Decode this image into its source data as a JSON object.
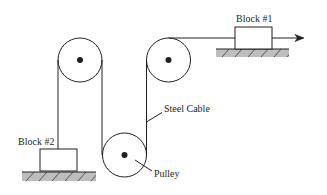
{
  "diagram": {
    "type": "pulley-cable-system",
    "colors": {
      "line": "#231f20",
      "ground": "#bdbdbd",
      "background": "#ffffff"
    },
    "labels": {
      "block1": "Block #1",
      "block2": "Block #2",
      "cable": "Steel Cable",
      "pulley": "Pulley"
    },
    "pulleys": [
      {
        "name": "top-left-pulley",
        "cx": 80,
        "cy": 60,
        "r": 22
      },
      {
        "name": "top-right-pulley",
        "cx": 168.5,
        "cy": 60,
        "r": 22
      },
      {
        "name": "bottom-pulley",
        "cx": 124.5,
        "cy": 155,
        "r": 22
      }
    ],
    "blocks": [
      {
        "name": "block-1",
        "x": 235,
        "y": 27,
        "w": 37,
        "h": 22
      },
      {
        "name": "block-2",
        "x": 40,
        "y": 149,
        "w": 37,
        "h": 22
      }
    ],
    "force_arrow": {
      "direction": "right",
      "icon": "arrow-right-icon"
    }
  }
}
